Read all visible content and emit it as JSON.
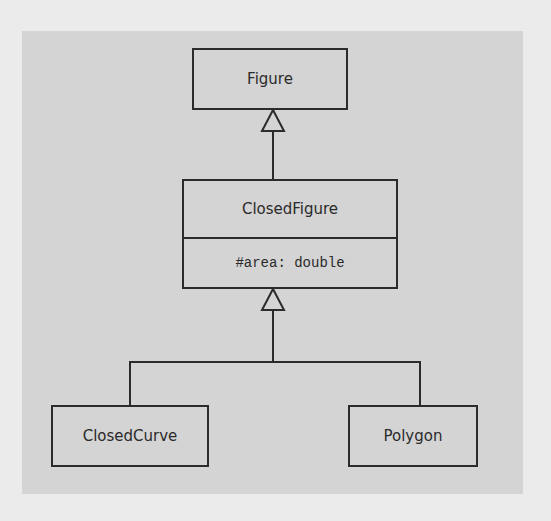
{
  "diagram": {
    "type": "uml-class-diagram",
    "colors": {
      "panel": "#d4d4d4",
      "background": "#ebebeb",
      "stroke": "#2b2b2b",
      "text": "#2a2a2a"
    },
    "classes": [
      {
        "id": "figure",
        "name": "Figure",
        "attributes": []
      },
      {
        "id": "closed_figure",
        "name": "ClosedFigure",
        "attributes": [
          "#area: double"
        ]
      },
      {
        "id": "closed_curve",
        "name": "ClosedCurve",
        "attributes": []
      },
      {
        "id": "polygon",
        "name": "Polygon",
        "attributes": []
      }
    ],
    "relations": [
      {
        "type": "generalization",
        "from": "ClosedFigure",
        "to": "Figure"
      },
      {
        "type": "generalization",
        "from": "ClosedCurve",
        "to": "ClosedFigure"
      },
      {
        "type": "generalization",
        "from": "Polygon",
        "to": "ClosedFigure"
      }
    ]
  }
}
